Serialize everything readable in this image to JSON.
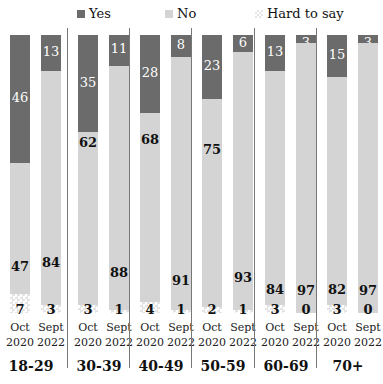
{
  "legend": [
    {
      "label": "Yes",
      "color": "#6b6b6b"
    },
    {
      "label": "No",
      "color": "#d4d4d4"
    },
    {
      "label": "Hard to say",
      "color": "#e6e6e6",
      "pattern": "checker"
    }
  ],
  "chart_data": {
    "type": "bar",
    "stacked": true,
    "orientation": "vertical",
    "title": "",
    "xlabel": "",
    "ylabel": "",
    "ylim": [
      0,
      100
    ],
    "grid": false,
    "legend_position": "top",
    "groups": [
      "18-29",
      "30-39",
      "40-49",
      "50-59",
      "60-69",
      "70+"
    ],
    "periods": [
      "Oct 2020",
      "Sept 2022"
    ],
    "categories": [
      "18-29 Oct 2020",
      "18-29 Sept 2022",
      "30-39 Oct 2020",
      "30-39 Sept 2022",
      "40-49 Oct 2020",
      "40-49 Sept 2022",
      "50-59 Oct 2020",
      "50-59 Sept 2022",
      "60-69 Oct 2020",
      "60-69 Sept 2022",
      "70+ Oct 2020",
      "70+ Sept 2022"
    ],
    "series": [
      {
        "name": "Yes",
        "values": [
          46,
          13,
          35,
          11,
          28,
          8,
          23,
          6,
          13,
          3,
          15,
          3
        ]
      },
      {
        "name": "No",
        "values": [
          47,
          84,
          62,
          88,
          68,
          91,
          75,
          93,
          84,
          97,
          82,
          97
        ]
      },
      {
        "name": "Hard to say",
        "values": [
          7,
          3,
          3,
          1,
          4,
          1,
          2,
          1,
          3,
          0,
          3,
          0
        ]
      }
    ]
  },
  "groups": [
    {
      "label": "18-29",
      "bars": [
        {
          "period_line1": "Oct",
          "period_line2": "2020",
          "yes": 46,
          "no": 47,
          "hard": 7
        },
        {
          "period_line1": "Sept",
          "period_line2": "2022",
          "yes": 13,
          "no": 84,
          "hard": 3
        }
      ]
    },
    {
      "label": "30-39",
      "bars": [
        {
          "period_line1": "Oct",
          "period_line2": "2020",
          "yes": 35,
          "no": 62,
          "hard": 3
        },
        {
          "period_line1": "Sept",
          "period_line2": "2022",
          "yes": 11,
          "no": 88,
          "hard": 1
        }
      ]
    },
    {
      "label": "40-49",
      "bars": [
        {
          "period_line1": "Oct",
          "period_line2": "2020",
          "yes": 28,
          "no": 68,
          "hard": 4
        },
        {
          "period_line1": "Sept",
          "period_line2": "2022",
          "yes": 8,
          "no": 91,
          "hard": 1
        }
      ]
    },
    {
      "label": "50-59",
      "bars": [
        {
          "period_line1": "Oct",
          "period_line2": "2020",
          "yes": 23,
          "no": 75,
          "hard": 2
        },
        {
          "period_line1": "Sept",
          "period_line2": "2022",
          "yes": 6,
          "no": 93,
          "hard": 1
        }
      ]
    },
    {
      "label": "60-69",
      "bars": [
        {
          "period_line1": "Oct",
          "period_line2": "2020",
          "yes": 13,
          "no": 84,
          "hard": 3
        },
        {
          "period_line1": "Sept",
          "period_line2": "2022",
          "yes": 3,
          "no": 97,
          "hard": 0
        }
      ]
    },
    {
      "label": "70+",
      "bars": [
        {
          "period_line1": "Oct",
          "period_line2": "2020",
          "yes": 15,
          "no": 82,
          "hard": 3
        },
        {
          "period_line1": "Sept",
          "period_line2": "2022",
          "yes": 3,
          "no": 97,
          "hard": 0
        }
      ]
    }
  ]
}
